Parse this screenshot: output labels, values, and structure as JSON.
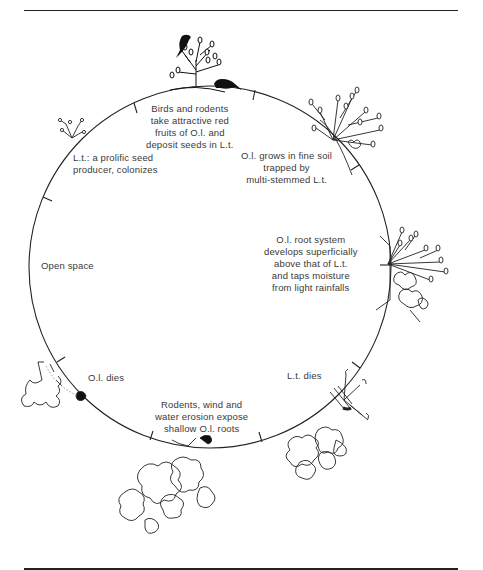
{
  "figure": {
    "rules": [
      "top",
      "bottom"
    ],
    "cycle_circle": {
      "cx": 210,
      "cy": 267,
      "r": 180,
      "stroke": "#222222"
    },
    "tick_count": 12
  },
  "stages": [
    {
      "id": "birds-rodents",
      "lines": [
        "Birds and rodents",
        "take attractive red",
        "fruits of O.l. and",
        "deposit seeds in L.t."
      ]
    },
    {
      "id": "ol-grows",
      "lines": [
        "O.l. grows in fine soil",
        "trapped by",
        "multi-stemmed L.t."
      ]
    },
    {
      "id": "ol-root-system",
      "lines": [
        "O.l. root system",
        "develops superficially",
        "above that of L.t.",
        "and taps moisture",
        "from light rainfalls"
      ]
    },
    {
      "id": "lt-dies",
      "lines": [
        "L.t. dies"
      ]
    },
    {
      "id": "erosion",
      "lines": [
        "Rodents, wind and",
        "water erosion expose",
        "shallow O.l. roots"
      ]
    },
    {
      "id": "ol-dies",
      "lines": [
        "O.l. dies"
      ]
    },
    {
      "id": "open-space",
      "lines": [
        "Open space"
      ]
    },
    {
      "id": "lt-colonizes",
      "lines": [
        "L.t.: a prolific seed",
        "producer, colonizes"
      ]
    }
  ],
  "illustrations": [
    "bird-icon",
    "rodent-icon",
    "shrub-lt-small-icon",
    "shrub-lt-top-right-icon",
    "shrub-ol-right-icon",
    "shrub-dead-lt-icon",
    "shrub-ol-dead-icon",
    "exposed-roots-icon"
  ]
}
